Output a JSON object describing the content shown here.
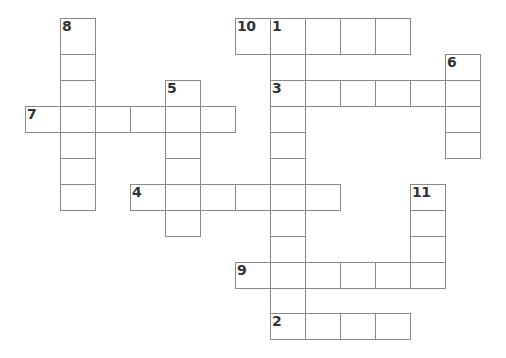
{
  "puzzle": {
    "type": "crossword",
    "grid": {
      "col_x": [
        25,
        60,
        95,
        130,
        165,
        200,
        235,
        270,
        305,
        340,
        375,
        410,
        445,
        480
      ],
      "row_y": [
        18,
        54,
        80,
        106,
        132,
        158,
        184,
        210,
        236,
        262,
        288,
        313,
        339
      ],
      "line_color": "#8a8a8a",
      "number_color": "#333333"
    },
    "entries": [
      {
        "number": "8",
        "direction": "down",
        "row": 0,
        "col": 1,
        "length": 7
      },
      {
        "number": "10",
        "direction": "across",
        "row": 0,
        "col": 6,
        "length": 5
      },
      {
        "number": "1",
        "direction": "down",
        "row": 0,
        "col": 7,
        "length": 12
      },
      {
        "number": "6",
        "direction": "down",
        "row": 1,
        "col": 12,
        "length": 4
      },
      {
        "number": "5",
        "direction": "down",
        "row": 2,
        "col": 4,
        "length": 6
      },
      {
        "number": "3",
        "direction": "across",
        "row": 2,
        "col": 7,
        "length": 6
      },
      {
        "number": "7",
        "direction": "across",
        "row": 3,
        "col": 0,
        "length": 6
      },
      {
        "number": "4",
        "direction": "across",
        "row": 6,
        "col": 3,
        "length": 6
      },
      {
        "number": "11",
        "direction": "down",
        "row": 6,
        "col": 11,
        "length": 4
      },
      {
        "number": "9",
        "direction": "across",
        "row": 9,
        "col": 6,
        "length": 6
      },
      {
        "number": "2",
        "direction": "across",
        "row": 11,
        "col": 7,
        "length": 4
      }
    ]
  }
}
